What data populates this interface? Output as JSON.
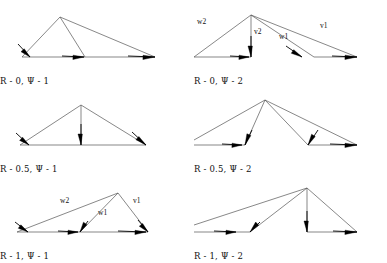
{
  "figure": {
    "width": 387,
    "height": 263,
    "background": "#ffffff",
    "line_color": "#555555",
    "arrow_color": "#000000",
    "text_color": "#111111",
    "rows": 3,
    "cols": 2
  },
  "panels": [
    {
      "id": "panel-r0-psi1",
      "caption": "R - 0, Ψ - 1",
      "origin": {
        "x": 0,
        "y": 0
      },
      "apex": {
        "x": 60,
        "y": 17
      },
      "baseline_y": 57,
      "thin_edges": [
        {
          "x1": 60,
          "y1": 17,
          "x2": 22,
          "y2": 57
        },
        {
          "x1": 60,
          "y1": 17,
          "x2": 85,
          "y2": 57
        },
        {
          "x1": 60,
          "y1": 17,
          "x2": 155,
          "y2": 57
        },
        {
          "x1": 22,
          "y1": 57,
          "x2": 155,
          "y2": 57
        }
      ],
      "arrows": [
        {
          "name": "arrow-left-down",
          "x1": 18,
          "y1": 44,
          "x2": 30,
          "y2": 57,
          "len": 10,
          "width": 6
        },
        {
          "name": "arrow-mid",
          "x1": 62,
          "y1": 56,
          "x2": 84,
          "y2": 57,
          "len": 11,
          "width": 6
        },
        {
          "name": "arrow-right",
          "x1": 128,
          "y1": 56,
          "x2": 155,
          "y2": 57,
          "len": 12,
          "width": 6
        }
      ],
      "labels": []
    },
    {
      "id": "panel-r0-psi2",
      "caption": "R - 0, Ψ - 2",
      "origin": {
        "x": 194,
        "y": 0
      },
      "apex": {
        "x": 57,
        "y": 15
      },
      "baseline_y": 57,
      "thin_edges": [
        {
          "x1": 57,
          "y1": 15,
          "x2": 0,
          "y2": 57
        },
        {
          "x1": 57,
          "y1": 15,
          "x2": 57,
          "y2": 57
        },
        {
          "x1": 57,
          "y1": 15,
          "x2": 120,
          "y2": 57
        },
        {
          "x1": 57,
          "y1": 15,
          "x2": 163,
          "y2": 57
        },
        {
          "x1": 0,
          "y1": 57,
          "x2": 57,
          "y2": 57
        },
        {
          "x1": 120,
          "y1": 57,
          "x2": 163,
          "y2": 57
        }
      ],
      "arrows": [
        {
          "name": "arrow-w2-base",
          "x1": 36,
          "y1": 56,
          "x2": 55,
          "y2": 57,
          "len": 10,
          "width": 6
        },
        {
          "name": "arrow-v2-down",
          "x1": 57,
          "y1": 36,
          "x2": 57,
          "y2": 57,
          "len": 11,
          "width": 6
        },
        {
          "name": "arrow-w1",
          "x1": 92,
          "y1": 46,
          "x2": 108,
          "y2": 57,
          "len": 11,
          "width": 6
        },
        {
          "name": "arrow-v1",
          "x1": 138,
          "y1": 56,
          "x2": 163,
          "y2": 57,
          "len": 12,
          "width": 6
        }
      ],
      "labels": [
        {
          "name": "vector-label-w2",
          "text": "w2",
          "x": 3,
          "y": 24
        },
        {
          "name": "vector-label-v2",
          "text": "v2",
          "x": 60,
          "y": 34
        },
        {
          "name": "vector-label-w1",
          "text": "w1",
          "x": 85,
          "y": 39
        },
        {
          "name": "vector-label-v1",
          "text": "v1",
          "x": 126,
          "y": 28
        }
      ]
    },
    {
      "id": "panel-r05-psi1",
      "caption": "R - 0.5, Ψ - 1",
      "origin": {
        "x": 0,
        "y": 88
      },
      "apex": {
        "x": 81,
        "y": 17
      },
      "baseline_y": 57,
      "thin_edges": [
        {
          "x1": 81,
          "y1": 17,
          "x2": 20,
          "y2": 57
        },
        {
          "x1": 81,
          "y1": 17,
          "x2": 81,
          "y2": 57
        },
        {
          "x1": 81,
          "y1": 17,
          "x2": 146,
          "y2": 57
        },
        {
          "x1": 20,
          "y1": 57,
          "x2": 146,
          "y2": 57
        }
      ],
      "arrows": [
        {
          "name": "arrow-left-down",
          "x1": 16,
          "y1": 45,
          "x2": 29,
          "y2": 57,
          "len": 10,
          "width": 6
        },
        {
          "name": "arrow-center-down",
          "x1": 81,
          "y1": 36,
          "x2": 81,
          "y2": 57,
          "len": 11,
          "width": 6
        },
        {
          "name": "arrow-right-down",
          "x1": 132,
          "y1": 44,
          "x2": 146,
          "y2": 57,
          "len": 11,
          "width": 6
        }
      ],
      "labels": []
    },
    {
      "id": "panel-r05-psi2",
      "caption": "R - 0.5, Ψ - 2",
      "origin": {
        "x": 194,
        "y": 88
      },
      "apex": {
        "x": 71,
        "y": 12
      },
      "baseline_y": 57,
      "thin_edges": [
        {
          "x1": 71,
          "y1": 12,
          "x2": 0,
          "y2": 52
        },
        {
          "x1": 71,
          "y1": 12,
          "x2": 51,
          "y2": 57
        },
        {
          "x1": 71,
          "y1": 12,
          "x2": 114,
          "y2": 57
        },
        {
          "x1": 71,
          "y1": 12,
          "x2": 163,
          "y2": 57
        },
        {
          "x1": 0,
          "y1": 57,
          "x2": 51,
          "y2": 57
        },
        {
          "x1": 114,
          "y1": 57,
          "x2": 163,
          "y2": 57
        }
      ],
      "arrows": [
        {
          "name": "arrow-w2-base",
          "x1": 28,
          "y1": 56,
          "x2": 48,
          "y2": 57,
          "len": 10,
          "width": 6
        },
        {
          "name": "arrow-v2",
          "x1": 58,
          "y1": 42,
          "x2": 51,
          "y2": 57,
          "len": 11,
          "width": 6
        },
        {
          "name": "arrow-w1",
          "x1": 124,
          "y1": 42,
          "x2": 114,
          "y2": 57,
          "len": 11,
          "width": 6
        },
        {
          "name": "arrow-v1",
          "x1": 136,
          "y1": 56,
          "x2": 163,
          "y2": 57,
          "len": 12,
          "width": 6
        }
      ],
      "labels": []
    },
    {
      "id": "panel-r1-psi1",
      "caption": "R - 1, Ψ - 1",
      "origin": {
        "x": 0,
        "y": 175
      },
      "apex": {
        "x": 118,
        "y": 18
      },
      "baseline_y": 57,
      "thin_edges": [
        {
          "x1": 118,
          "y1": 18,
          "x2": 17,
          "y2": 57
        },
        {
          "x1": 118,
          "y1": 18,
          "x2": 80,
          "y2": 57
        },
        {
          "x1": 118,
          "y1": 18,
          "x2": 148,
          "y2": 57
        },
        {
          "x1": 17,
          "y1": 57,
          "x2": 148,
          "y2": 57
        }
      ],
      "arrows": [
        {
          "name": "arrow-w2-tip",
          "x1": 15,
          "y1": 47,
          "x2": 28,
          "y2": 57,
          "len": 10,
          "width": 6
        },
        {
          "name": "arrow-base-mid",
          "x1": 58,
          "y1": 56,
          "x2": 78,
          "y2": 57,
          "len": 10,
          "width": 6
        },
        {
          "name": "arrow-w1",
          "x1": 88,
          "y1": 46,
          "x2": 80,
          "y2": 57,
          "len": 10,
          "width": 6
        },
        {
          "name": "arrow-v1",
          "x1": 138,
          "y1": 45,
          "x2": 148,
          "y2": 57,
          "len": 10,
          "width": 6
        },
        {
          "name": "arrow-base-right",
          "x1": 118,
          "y1": 56,
          "x2": 146,
          "y2": 57,
          "len": 11,
          "width": 6
        }
      ],
      "labels": [
        {
          "name": "vector-label-w2",
          "text": "w2",
          "x": 60,
          "y": 28
        },
        {
          "name": "vector-label-w1",
          "text": "w1",
          "x": 98,
          "y": 40
        },
        {
          "name": "vector-label-v1",
          "text": "v1",
          "x": 133,
          "y": 28
        }
      ]
    },
    {
      "id": "panel-r1-psi2",
      "caption": "R - 1, Ψ - 2",
      "origin": {
        "x": 194,
        "y": 175
      },
      "apex": {
        "x": 113,
        "y": 13
      },
      "baseline_y": 57,
      "thin_edges": [
        {
          "x1": 113,
          "y1": 13,
          "x2": 0,
          "y2": 50
        },
        {
          "x1": 113,
          "y1": 13,
          "x2": 56,
          "y2": 57
        },
        {
          "x1": 113,
          "y1": 13,
          "x2": 113,
          "y2": 57
        },
        {
          "x1": 113,
          "y1": 13,
          "x2": 163,
          "y2": 57
        },
        {
          "x1": 0,
          "y1": 57,
          "x2": 56,
          "y2": 57
        },
        {
          "x1": 113,
          "y1": 57,
          "x2": 163,
          "y2": 57
        }
      ],
      "arrows": [
        {
          "name": "arrow-base-left",
          "x1": 20,
          "y1": 56,
          "x2": 42,
          "y2": 57,
          "len": 10,
          "width": 6
        },
        {
          "name": "arrow-w2",
          "x1": 66,
          "y1": 47,
          "x2": 56,
          "y2": 57,
          "len": 11,
          "width": 6
        },
        {
          "name": "arrow-v2-down",
          "x1": 113,
          "y1": 36,
          "x2": 113,
          "y2": 57,
          "len": 11,
          "width": 6
        },
        {
          "name": "arrow-v1",
          "x1": 139,
          "y1": 56,
          "x2": 163,
          "y2": 57,
          "len": 12,
          "width": 6
        }
      ],
      "labels": []
    }
  ]
}
